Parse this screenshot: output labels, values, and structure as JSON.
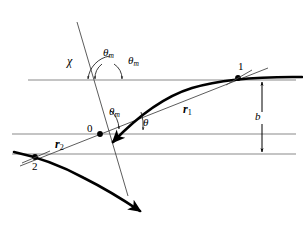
{
  "figure": {
    "colors": {
      "curve": "#000000",
      "asymptote": "#3a3a3a",
      "baseline": "#808080",
      "text": "#000000",
      "background": "#ffffff"
    }
  },
  "labels": {
    "chi": "χ",
    "theta_m_top_left": "θ",
    "theta_m_top_left_sub": "m",
    "theta_m_top_right": "θ",
    "theta_m_top_right_sub": "m",
    "theta_m_center": "θ",
    "theta_m_center_sub": "m",
    "theta": "θ",
    "r1": "r",
    "r1_sub": "1",
    "r2": "r",
    "r2_sub": "2",
    "impact_parameter": "b",
    "origin": "0",
    "point_one": "1",
    "point_two": "2"
  },
  "geometry": {
    "lines": {
      "top_horizontal_y": 80,
      "middle_horizontal_y": 134,
      "bottom_horizontal_y": 154,
      "origin_x": 100,
      "origin_y": 134,
      "point_one_x": 238,
      "point_one_y": 78,
      "point_two_x": 35,
      "point_two_y": 158
    },
    "impact_parameter_span": {
      "from_y": 80,
      "to_y": 154,
      "x": 262
    }
  }
}
